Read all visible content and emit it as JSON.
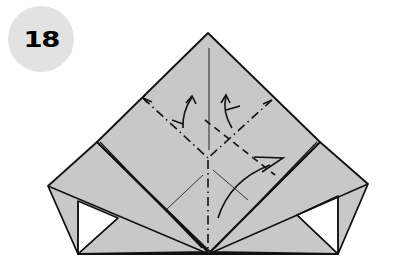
{
  "step": {
    "number": "18"
  },
  "colors": {
    "paper": "#c8c8c8",
    "line": "#111111",
    "badge": "#e2e2e2",
    "background": "#ffffff"
  },
  "diagram": {
    "icons": [
      "fold-arrow-left",
      "fold-arrow-right",
      "fold-arrow-curve-right"
    ]
  }
}
